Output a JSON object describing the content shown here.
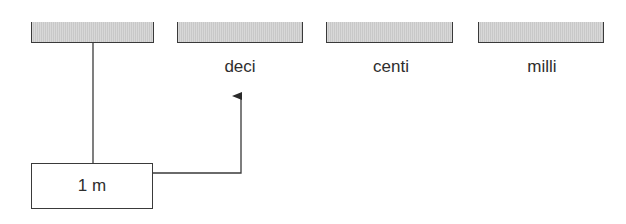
{
  "diagram": {
    "bars": [
      {
        "id": "base",
        "label": null
      },
      {
        "id": "deci",
        "label": "deci"
      },
      {
        "id": "centi",
        "label": "centi"
      },
      {
        "id": "milli",
        "label": "milli"
      }
    ],
    "source_box": {
      "label": "1 m"
    },
    "colors": {
      "bar_fill": "#d0d0d0",
      "stroke": "#3a3a3a",
      "text": "#2e2e2e",
      "background": "#ffffff"
    },
    "connectors": [
      {
        "from": "base",
        "to": "source_box",
        "type": "line"
      },
      {
        "from": "source_box",
        "to": "deci",
        "type": "arrow"
      }
    ]
  }
}
